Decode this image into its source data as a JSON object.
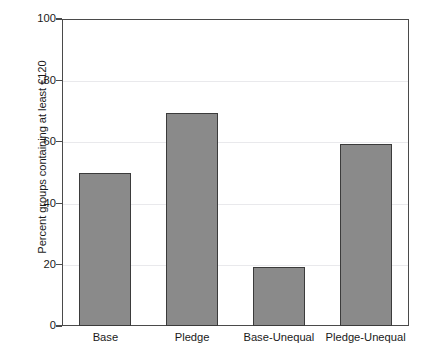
{
  "chart_data": {
    "type": "bar",
    "title": "",
    "subtitle": "",
    "xlabel": "",
    "ylabel": "Percent groups containing at least €120",
    "categories": [
      "Base",
      "Pledge",
      "Base-Unequal",
      "Pledge-Unequal"
    ],
    "values": [
      49.9,
      69.5,
      19.3,
      59.4
    ],
    "series": [
      {
        "name": "Percent groups containing at least €120",
        "values": [
          49.9,
          69.5,
          19.3,
          59.4
        ]
      }
    ],
    "ylim": [
      0,
      100
    ],
    "yticks": [
      0,
      20,
      40,
      60,
      80,
      100
    ],
    "ytick_labels": [
      "0",
      "20",
      "40",
      "60",
      "80",
      "100"
    ],
    "grid": true,
    "grid_axis": "y",
    "legend": false,
    "legend_position": "none",
    "bar_color": "#8a8a8a",
    "bar_edge_color": "#3b3b3b",
    "axis_color": "#4a4a4a",
    "grid_color": "#e9e9ec",
    "background_color": "#ffffff",
    "annotations": []
  },
  "axes": {
    "y_title": "Percent groups containing at least €120",
    "y_ticks": [
      {
        "label": "100",
        "value": 100
      },
      {
        "label": "80",
        "value": 80
      },
      {
        "label": "60",
        "value": 60
      },
      {
        "label": "40",
        "value": 40
      },
      {
        "label": "20",
        "value": 20
      },
      {
        "label": "0",
        "value": 0
      }
    ],
    "x_ticks": [
      {
        "label": "Base"
      },
      {
        "label": "Pledge"
      },
      {
        "label": "Base-Unequal"
      },
      {
        "label": "Pledge-Unequal"
      }
    ]
  }
}
